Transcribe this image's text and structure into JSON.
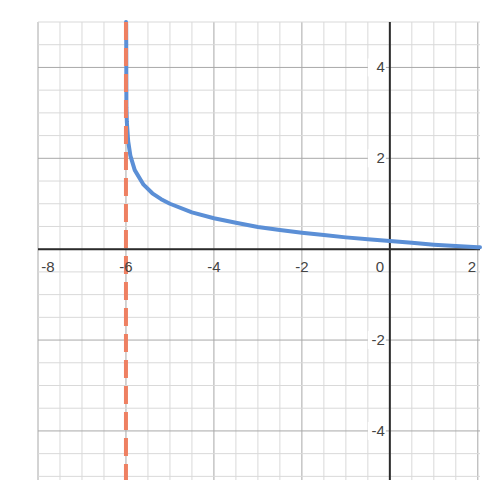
{
  "chart_data": {
    "type": "line",
    "title": "",
    "xlabel": "",
    "ylabel": "",
    "xlim": [
      -8,
      2.05
    ],
    "ylim": [
      -5.08,
      5
    ],
    "grid": true,
    "minor_grid_step": 0.5,
    "major_grid_step": 2,
    "x_ticks": [
      -8,
      -6,
      -4,
      -2,
      0,
      2
    ],
    "x_tick_labels": [
      "-8",
      "-6",
      "-4",
      "-2",
      "0",
      "2"
    ],
    "y_ticks": [
      -4,
      -2,
      2,
      4
    ],
    "y_tick_labels": [
      "-4",
      "-2",
      "2",
      "4"
    ],
    "series": [
      {
        "name": "curve",
        "color": "#5b8fd6",
        "style": "solid",
        "description": "decreasing logarithmic curve with vertical asymptote at x = -6",
        "points": [
          [
            -5.995,
            4.95
          ],
          [
            -5.99,
            3.12
          ],
          [
            -5.98,
            2.8
          ],
          [
            -5.95,
            2.38
          ],
          [
            -5.9,
            2.06
          ],
          [
            -5.8,
            1.74
          ],
          [
            -5.6,
            1.42
          ],
          [
            -5.4,
            1.23
          ],
          [
            -5.2,
            1.1
          ],
          [
            -5.0,
            1.0
          ],
          [
            -4.5,
            0.81
          ],
          [
            -4.0,
            0.68
          ],
          [
            -3.5,
            0.58
          ],
          [
            -3.0,
            0.49
          ],
          [
            -2.5,
            0.42
          ],
          [
            -2.0,
            0.36
          ],
          [
            -1.5,
            0.31
          ],
          [
            -1.0,
            0.26
          ],
          [
            -0.5,
            0.22
          ],
          [
            0.0,
            0.18
          ],
          [
            0.5,
            0.14
          ],
          [
            1.0,
            0.1
          ],
          [
            1.5,
            0.07
          ],
          [
            2.0,
            0.04
          ],
          [
            2.05,
            0.04
          ]
        ]
      },
      {
        "name": "asymptote",
        "color": "#ee8062",
        "style": "dashed",
        "x": -6,
        "description": "vertical asymptote x = -6"
      }
    ]
  }
}
